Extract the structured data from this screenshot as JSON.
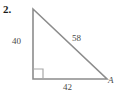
{
  "figure": {
    "problem_number": "2.",
    "shape": "right-triangle",
    "background_color": "#ffffff",
    "stroke_color": "#8c8c8c",
    "label_color": "#4a4a4a",
    "number_color": "#1a1a1a",
    "geometry": {
      "apex": [
        33,
        9
      ],
      "right_angle_vertex": [
        33,
        79
      ],
      "vertex_a": [
        107,
        79
      ],
      "right_angle_marker_size": 10
    },
    "labels": {
      "leg_vertical": "40",
      "hypotenuse": "58",
      "leg_horizontal": "42",
      "vertex_a": "A"
    }
  }
}
